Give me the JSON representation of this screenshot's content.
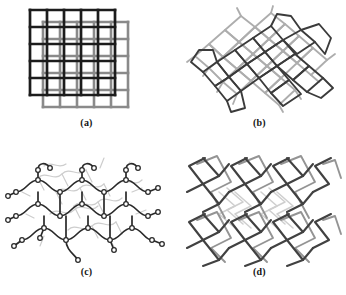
{
  "figure": {
    "background_color": "#ffffff",
    "panel_count": 4,
    "dark_stroke_color": "#1c1c1c",
    "mid_stroke_color": "#6e6e6e",
    "light_stroke_color": "#b9b9b9",
    "pale_stroke_color": "#d4d4d4"
  },
  "panels": [
    {
      "id": "a",
      "label": "(a)",
      "motif": "two-overlapping-square-grids",
      "description": "Two identical square grid nets, one black and one gray, offset diagonally to illustrate two-fold interpenetration of 2D square lattices",
      "nets": [
        {
          "name": "net-black",
          "color": "#1c1c1c",
          "stroke_width": 2.6,
          "origin_x": 18,
          "origin_y": 10,
          "cell": 17,
          "divisions": 5
        },
        {
          "name": "net-gray",
          "color": "#8a8a8a",
          "stroke_width": 2.6,
          "origin_x": 31,
          "origin_y": 22,
          "cell": 17,
          "divisions": 5
        }
      ]
    },
    {
      "id": "b",
      "label": "(b)",
      "motif": "inclined-interpenetrating-square-nets",
      "description": "Two inclined 2D square grid sheets shown in perspective, drawn as tilted rhombic rings that interweave",
      "nets": [
        {
          "name": "net-dark",
          "color": "#3a3a3a",
          "stroke_width": 1.7
        },
        {
          "name": "net-light",
          "color": "#a8a8a8",
          "stroke_width": 1.7
        }
      ]
    },
    {
      "id": "c",
      "label": "(c)",
      "motif": "ball-and-stick-coordination-network",
      "description": "Ball-and-stick representation of an interpenetrating coordination polymer; dark atoms and bonds in front, pale duplicate net behind",
      "nets": [
        {
          "name": "net-front",
          "color": "#2a2a2a",
          "stroke_width": 1.6,
          "atom_radius": 2.1
        },
        {
          "name": "net-back",
          "color": "#c6c6c6",
          "stroke_width": 1.2,
          "atom_radius": 1.6
        }
      ]
    },
    {
      "id": "d",
      "label": "(d)",
      "motif": "interpenetrating-zigzag-diamondoid-net",
      "description": "Interpenetrating zigzag chains forming a diamondoid framework, dark chains in front and gray chains behind",
      "nets": [
        {
          "name": "net-front",
          "color": "#444444",
          "stroke_width": 2.0
        },
        {
          "name": "net-mid",
          "color": "#8e8e8e",
          "stroke_width": 1.8
        },
        {
          "name": "net-back",
          "color": "#c9c9c9",
          "stroke_width": 1.6
        }
      ]
    }
  ]
}
